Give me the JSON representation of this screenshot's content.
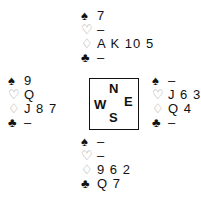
{
  "suits": {
    "spades": "♠",
    "hearts": "♡",
    "diamonds": "♢",
    "clubs": "♣"
  },
  "compass": {
    "north": "N",
    "west": "W",
    "east": "E",
    "south": "S"
  },
  "hands": {
    "north": {
      "spades": "7",
      "hearts": "–",
      "diamonds": "A K 10 5",
      "clubs": "–"
    },
    "west": {
      "spades": "9",
      "hearts": "Q",
      "diamonds": "J 8 7",
      "clubs": "–"
    },
    "east": {
      "spades": "–",
      "hearts": "J 6 3",
      "diamonds": "Q 4",
      "clubs": "–"
    },
    "south": {
      "spades": "–",
      "hearts": "–",
      "diamonds": "9 6 2",
      "clubs": "Q 7"
    }
  }
}
